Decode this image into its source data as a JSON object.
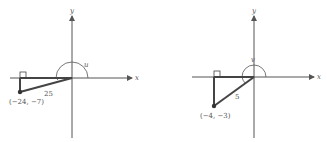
{
  "figures": [
    {
      "name": "left",
      "axis_x_label": "x",
      "axis_y_label": "y",
      "angle_label": "u",
      "hypotenuse_label": "25",
      "point_label": "(−24, −7)"
    },
    {
      "name": "right",
      "axis_x_label": "x",
      "axis_y_label": "y",
      "angle_label": "v",
      "hypotenuse_label": "5",
      "point_label": "(−4, −3)"
    }
  ],
  "colors": {
    "axis": "#555555",
    "triangle": "#444444",
    "text": "#555555"
  }
}
